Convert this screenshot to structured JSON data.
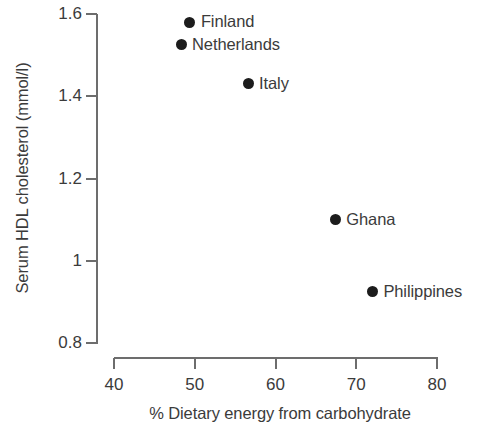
{
  "chart_data": {
    "type": "scatter",
    "title": "",
    "xlabel": "% Dietary energy from carbohydrate",
    "ylabel": "Serum HDL cholesterol (mmol/l)",
    "xlim": [
      40,
      80
    ],
    "ylim": [
      0.8,
      1.6
    ],
    "xticks": [
      "40",
      "50",
      "60",
      "70",
      "80"
    ],
    "xtick_values": [
      40,
      50,
      60,
      70,
      80
    ],
    "yticks": [
      "0.8",
      "1",
      "1.2",
      "1.4",
      "1.6"
    ],
    "ytick_values": [
      0.8,
      1.0,
      1.2,
      1.4,
      1.6
    ],
    "grid": false,
    "legend": "none",
    "marker_color": "#1c1c1c",
    "axis_color": "#6d6d6d",
    "text_color": "#3b3b3b",
    "points": [
      {
        "label": "Finland",
        "x": 49.4,
        "y": 1.58
      },
      {
        "label": "Netherlands",
        "x": 48.3,
        "y": 1.525
      },
      {
        "label": "Italy",
        "x": 56.6,
        "y": 1.43
      },
      {
        "label": "Ghana",
        "x": 67.4,
        "y": 1.1
      },
      {
        "label": "Philippines",
        "x": 72.0,
        "y": 0.925
      }
    ]
  }
}
